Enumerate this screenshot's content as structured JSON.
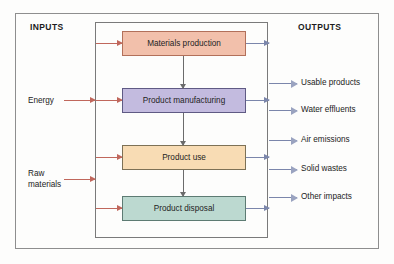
{
  "diagram": {
    "columns": {
      "inputs_heading": "INPUTS",
      "outputs_heading": "OUTPUTS"
    },
    "system_boundary_label": "",
    "stages": [
      {
        "label": "Materials production",
        "fill": "#f2c0ab",
        "stroke": "#b2705a"
      },
      {
        "label": "Product manufacturing",
        "fill": "#c3bbdf",
        "stroke": "#5f5a84"
      },
      {
        "label": "Product use",
        "fill": "#f8dcb4",
        "stroke": "#7d7156"
      },
      {
        "label": "Product disposal",
        "fill": "#bcd9d0",
        "stroke": "#5d7b73"
      }
    ],
    "inputs": [
      {
        "label": "Energy"
      },
      {
        "label": "Raw\nmaterials"
      }
    ],
    "outputs": [
      {
        "label": "Usable products"
      },
      {
        "label": "Water effluents"
      },
      {
        "label": "Air emissions"
      },
      {
        "label": "Solid wastes"
      },
      {
        "label": "Other impacts"
      }
    ],
    "colors": {
      "input_arrow": "#c0675c",
      "output_arrow": "#7b86ab",
      "flow_arrow": "#6b6b6b",
      "frame": "#8e8e8e",
      "boundary": "#7a7a7a",
      "text": "#232323",
      "page_background": "#fdfdfc"
    }
  }
}
